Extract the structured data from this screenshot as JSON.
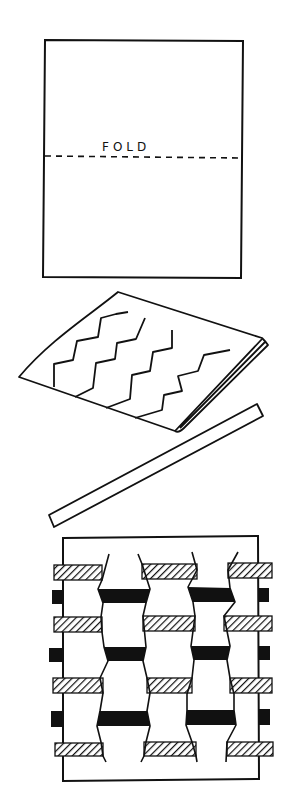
{
  "figure": {
    "steps": [
      {
        "id": "step-1",
        "description": "Sheet of paper with fold line",
        "label": "FOLD"
      },
      {
        "id": "step-2",
        "description": "Folded sheet with zigzag cut lines and separate paper strip"
      },
      {
        "id": "step-3",
        "description": "Woven mat with hatched and black strips through cut slits"
      }
    ],
    "colors": {
      "ink": "#111111",
      "paper": "#ffffff"
    }
  }
}
